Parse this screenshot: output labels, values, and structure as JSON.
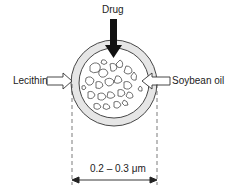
{
  "diagram": {
    "labels": {
      "drug": "Drug",
      "lecithin": "Lecithin",
      "soybean_oil": "Soybean oil",
      "size": "0.2 – 0.3 μm"
    },
    "arrows": [
      {
        "from": "Drug",
        "direction": "down",
        "style": "solid-black"
      },
      {
        "from": "Lecithin",
        "direction": "right",
        "style": "hollow"
      },
      {
        "from": "Soybean oil",
        "direction": "left",
        "style": "hollow"
      }
    ],
    "dimension": {
      "label": "0.2 – 0.3 μm",
      "type": "diameter"
    },
    "colors": {
      "stroke": "#222222",
      "shell": "#e6e6e6",
      "background": "#ffffff"
    }
  }
}
